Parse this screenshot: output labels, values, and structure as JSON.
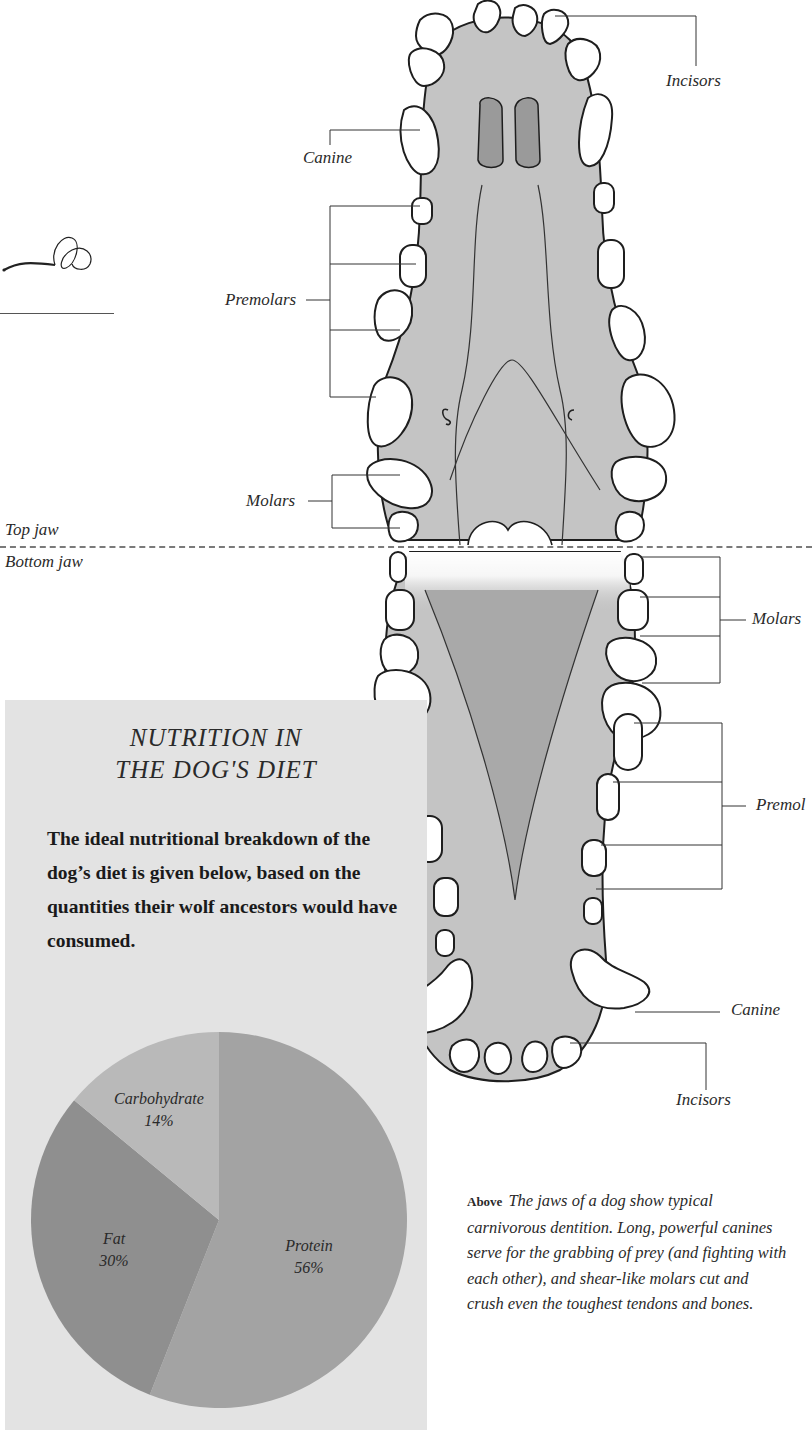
{
  "diagram": {
    "top_jaw_label": "Top jaw",
    "bottom_jaw_label": "Bottom jaw",
    "top_labels": {
      "incisors": "Incisors",
      "canine": "Canine",
      "premolars": "Premolars",
      "molars": "Molars"
    },
    "bottom_labels": {
      "molars": "Molars",
      "premolars": "Premol",
      "canine": "Canine",
      "incisors": "Incisors"
    },
    "colors": {
      "gum": "#c4c4c4",
      "tooth": "#ffffff",
      "outline": "#1e1e1e",
      "nostril": "#9a9a9a"
    }
  },
  "panel": {
    "title_line1": "NUTRITION IN",
    "title_line2": "THE DOG'S DIET",
    "body": "The ideal nutritional breakdown of the dog’s diet is given below, based on the quantities their wolf ancestors would have consumed.",
    "background": "#e3e3e3"
  },
  "chart_data": {
    "type": "pie",
    "title": "NUTRITION IN THE DOG'S DIET",
    "categories": [
      "Protein",
      "Fat",
      "Carbohydrate"
    ],
    "values": [
      56,
      30,
      14
    ],
    "unit": "%",
    "labels": [
      "Protein 56%",
      "Fat 30%",
      "Carbohydrate 14%"
    ],
    "colors": [
      "#a3a3a3",
      "#8f8f8f",
      "#b9b9b9"
    ],
    "start_angle_deg": 0,
    "direction": "clockwise",
    "legend": "none (labels inside slices)"
  },
  "caption": {
    "lead": "Above",
    "text": "The jaws of a dog show typical carnivorous dentition. Long, powerful canines serve for the grabbing of prey (and fighting with each other), and shear-like molars cut and crush even the toughest tendons and bones."
  }
}
